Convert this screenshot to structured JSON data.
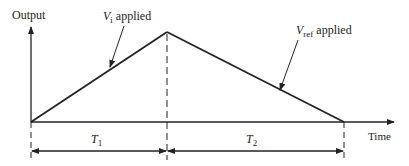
{
  "diagram": {
    "type": "dual-slope integration timing diagram",
    "y_axis_label": "Output",
    "x_axis_label": "Time",
    "annotations": {
      "rise": {
        "symbol": "V",
        "subscript": "i",
        "text": "applied"
      },
      "fall": {
        "symbol": "V",
        "subscript": "ref",
        "text": "applied"
      }
    },
    "intervals": [
      {
        "symbol": "T",
        "subscript": "1"
      },
      {
        "symbol": "T",
        "subscript": "2"
      }
    ],
    "colors": {
      "line": "#222222",
      "background": "#ffffff"
    }
  }
}
